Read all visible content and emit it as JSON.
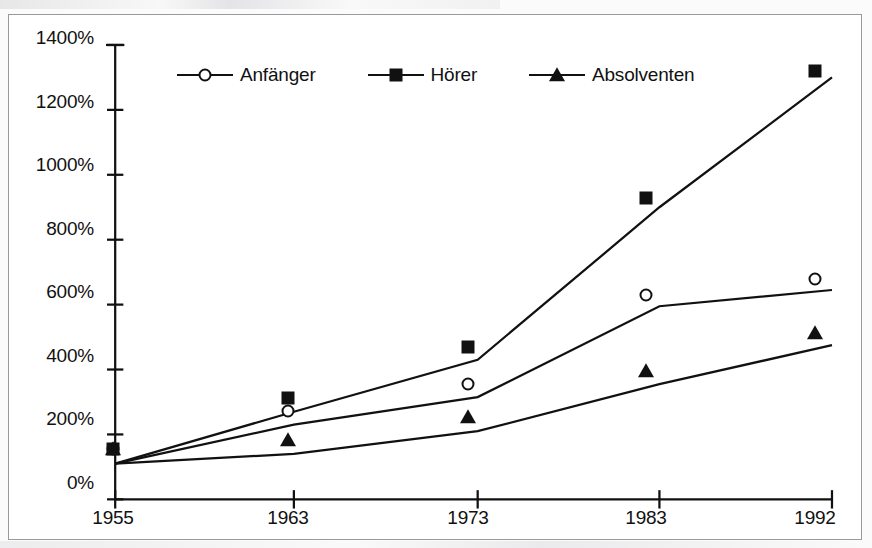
{
  "chart_data": {
    "type": "line",
    "title": "",
    "subtitle": "",
    "xlabel": "",
    "ylabel": "",
    "categories": [
      "1955",
      "1963",
      "1973",
      "1983",
      "1992"
    ],
    "xtick_labels": [
      "1955",
      "1963",
      "1973",
      "1983",
      "1992"
    ],
    "ytick_labels": [
      "0%",
      "200%",
      "400%",
      "600%",
      "800%",
      "1000%",
      "1200%",
      "1400%"
    ],
    "ytick_values": [
      0,
      200,
      400,
      600,
      800,
      1000,
      1200,
      1400
    ],
    "ylim": [
      0,
      1400
    ],
    "ytick_step": 200,
    "yaxis_unit": "%",
    "grid": false,
    "legend_position": "top-inside",
    "series": [
      {
        "name": "Anfänger",
        "marker": "open-circle",
        "color": "#111111",
        "values": [
          110,
          230,
          315,
          595,
          645
        ]
      },
      {
        "name": "Hörer",
        "marker": "filled-square",
        "color": "#111111",
        "values": [
          110,
          270,
          430,
          900,
          1300
        ]
      },
      {
        "name": "Absolventen",
        "marker": "filled-triangle",
        "color": "#111111",
        "values": [
          110,
          140,
          210,
          355,
          475
        ]
      }
    ],
    "annotations": []
  },
  "legend": {
    "items": [
      {
        "label": "Anfänger",
        "marker": "open-circle"
      },
      {
        "label": "Hörer",
        "marker": "filled-square"
      },
      {
        "label": "Absolventen",
        "marker": "filled-triangle"
      }
    ]
  },
  "axes": {
    "y_labels": [
      "1400%",
      "1200%",
      "1000%",
      "800%",
      "600%",
      "400%",
      "200%",
      "0%"
    ],
    "x_labels": [
      "1955",
      "1963",
      "1973",
      "1983",
      "1992"
    ]
  },
  "colors": {
    "ink": "#111111",
    "frame": "#9a9a9a",
    "plot_background": "#ffffff",
    "page_background": "#f2f2f2"
  }
}
